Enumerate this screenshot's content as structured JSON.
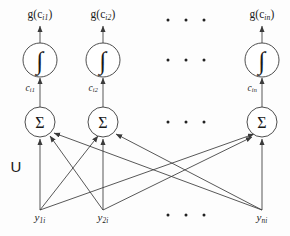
{
  "figure": {
    "width": 290,
    "height": 236,
    "background_color": "#fdfdfd",
    "stroke_color": "#3a3a3a",
    "text_color": "#1a1a1a"
  },
  "weight_matrix": {
    "label": "U",
    "x": 16,
    "y": 166
  },
  "columns": [
    {
      "id": "col-1",
      "x": 40
    },
    {
      "id": "col-2",
      "x": 103
    },
    {
      "id": "col-n",
      "x": 262
    }
  ],
  "rows": {
    "output_label_y": 16,
    "activation_y": 60,
    "weight_label_y": 84,
    "summation_y": 122,
    "input_label_y": 219
  },
  "activation_nodes": [
    {
      "id": "activation-1",
      "glyph": "∫",
      "cx": 40,
      "cy": 60,
      "r": 17
    },
    {
      "id": "activation-2",
      "glyph": "∫",
      "cx": 103,
      "cy": 60,
      "r": 17
    },
    {
      "id": "activation-n",
      "glyph": "∫",
      "cx": 262,
      "cy": 60,
      "r": 17
    }
  ],
  "summation_nodes": [
    {
      "id": "summation-1",
      "glyph": "Σ",
      "cx": 40,
      "cy": 122,
      "r": 15
    },
    {
      "id": "summation-2",
      "glyph": "Σ",
      "cx": 103,
      "cy": 122,
      "r": 15
    },
    {
      "id": "summation-n",
      "glyph": "Σ",
      "cx": 262,
      "cy": 122,
      "r": 15
    }
  ],
  "output_labels": [
    {
      "id": "output-1",
      "base": "g(c",
      "sub": "i1",
      "close": ")",
      "x": 40,
      "y": 16
    },
    {
      "id": "output-2",
      "base": "g(c",
      "sub": "i2",
      "close": ")",
      "x": 103,
      "y": 16
    },
    {
      "id": "output-n",
      "base": "g(c",
      "sub": "in",
      "close": ")",
      "x": 262,
      "y": 16
    }
  ],
  "weight_labels": [
    {
      "id": "weight-1",
      "base": "c",
      "sub": "i1",
      "x": 35,
      "y": 84
    },
    {
      "id": "weight-2",
      "base": "c",
      "sub": "i2",
      "x": 98,
      "y": 84
    },
    {
      "id": "weight-n",
      "base": "c",
      "sub": "in",
      "x": 257,
      "y": 84
    }
  ],
  "input_labels": [
    {
      "id": "input-1",
      "base": "y",
      "sub": "1i",
      "x": 40,
      "y": 219
    },
    {
      "id": "input-2",
      "base": "y",
      "sub": "2i",
      "x": 103,
      "y": 219
    },
    {
      "id": "input-n",
      "base": "y",
      "sub": "ni",
      "x": 262,
      "y": 219
    }
  ],
  "ellipses": [
    {
      "id": "ellipsis-output",
      "x": 186,
      "y": 20,
      "count": 3
    },
    {
      "id": "ellipsis-activation",
      "x": 186,
      "y": 60,
      "count": 3
    },
    {
      "id": "ellipsis-summation",
      "x": 186,
      "y": 122,
      "count": 3
    },
    {
      "id": "ellipsis-input",
      "x": 186,
      "y": 215,
      "count": 3
    }
  ],
  "edges": {
    "description": "Fully connected from each input node to each summation node",
    "from": [
      "input-1",
      "input-2",
      "input-n"
    ],
    "to": [
      "summation-1",
      "summation-2",
      "summation-n"
    ]
  }
}
